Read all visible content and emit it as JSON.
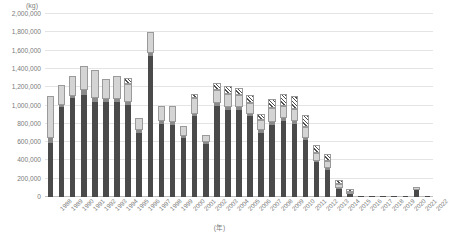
{
  "chart_data": {
    "type": "bar",
    "stacked": true,
    "title": "",
    "subtitle": "",
    "xlabel": "(年)",
    "ylabel": "",
    "unit_label": "(kg)",
    "ylim": [
      0,
      2000000
    ],
    "ytick_values": [
      0,
      200000,
      400000,
      600000,
      800000,
      1000000,
      1200000,
      1400000,
      1600000,
      1800000,
      2000000
    ],
    "ytick_labels": [
      "0",
      "200,000",
      "400,000",
      "600,000",
      "800,000",
      "1,000,000",
      "1,200,000",
      "1,400,000",
      "1,600,000",
      "1,800,000",
      "2,000,000"
    ],
    "grid": true,
    "legend": "none",
    "categories": [
      "1988",
      "1989",
      "1990",
      "1991",
      "1992",
      "1993",
      "1994",
      "1995",
      "1996",
      "1997",
      "1998",
      "1999",
      "2000",
      "2001",
      "2002",
      "2003",
      "2004",
      "2005",
      "2006",
      "2007",
      "2008",
      "2009",
      "2010",
      "2011",
      "2012",
      "2013",
      "2014",
      "2015",
      "2016",
      "2017",
      "2018",
      "2019",
      "2020",
      "2021",
      "2022"
    ],
    "series": [
      {
        "name": "segment-a",
        "color": "#4a4a4a",
        "pattern": "solid-dark",
        "values": [
          590000,
          980000,
          1080000,
          1110000,
          1040000,
          1040000,
          1040000,
          1010000,
          700000,
          1540000,
          800000,
          790000,
          640000,
          880000,
          580000,
          1000000,
          950000,
          950000,
          880000,
          700000,
          790000,
          830000,
          800000,
          620000,
          380000,
          300000,
          90000,
          30000,
          2000,
          1000,
          1000,
          1000,
          1000,
          80000,
          1000
        ]
      },
      {
        "name": "segment-b",
        "color": "#8a8a8a",
        "pattern": "solid-medium",
        "values": [
          70000,
          40000,
          40000,
          70000,
          50000,
          40000,
          40000,
          40000,
          40000,
          50000,
          40000,
          40000,
          40000,
          40000,
          30000,
          40000,
          40000,
          40000,
          40000,
          40000,
          40000,
          40000,
          40000,
          40000,
          30000,
          30000,
          20000,
          10000,
          0,
          0,
          0,
          0,
          0,
          10000,
          0
        ]
      },
      {
        "name": "segment-c",
        "color": "#d4d4d4",
        "pattern": "solid-light",
        "values": [
          430000,
          190000,
          190000,
          240000,
          290000,
          200000,
          230000,
          180000,
          110000,
          200000,
          140000,
          150000,
          90000,
          160000,
          60000,
          130000,
          140000,
          120000,
          110000,
          100000,
          140000,
          130000,
          120000,
          110000,
          70000,
          60000,
          30000,
          20000,
          0,
          0,
          0,
          0,
          0,
          10000,
          0
        ]
      },
      {
        "name": "segment-d",
        "color": "#ffffff",
        "pattern": "diagonal-hatch",
        "values": [
          0,
          0,
          0,
          0,
          0,
          0,
          0,
          60000,
          0,
          0,
          0,
          0,
          0,
          40000,
          0,
          60000,
          70000,
          70000,
          70000,
          60000,
          90000,
          110000,
          130000,
          120000,
          80000,
          70000,
          40000,
          20000,
          0,
          0,
          0,
          0,
          0,
          0,
          0
        ]
      }
    ]
  }
}
